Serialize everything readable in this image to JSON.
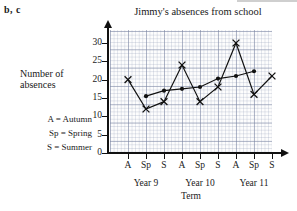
{
  "figure_tag": "b, c",
  "chart_data": {
    "type": "line",
    "title": "Jimmy's absences from school",
    "xlabel": "Term",
    "ylabel": "Number of absences",
    "ylim": [
      0,
      32
    ],
    "yticks": [
      0,
      5,
      10,
      15,
      20,
      25,
      30
    ],
    "grid": true,
    "legend_position": "none",
    "categories": [
      "A",
      "Sp",
      "S",
      "A",
      "Sp",
      "S",
      "A",
      "Sp",
      "S"
    ],
    "group_labels": [
      "Year 9",
      "Year 10",
      "Year 11"
    ],
    "series": [
      {
        "name": "Absences",
        "marker": "x",
        "x": [
          1,
          2,
          3,
          4,
          5,
          6,
          7,
          8,
          9
        ],
        "values": [
          20,
          12,
          14,
          24,
          14,
          18,
          30,
          16,
          21
        ]
      },
      {
        "name": "Moving average",
        "marker": "dot",
        "x": [
          2,
          3,
          4,
          5,
          6,
          7,
          8
        ],
        "values": [
          15.5,
          17,
          17.5,
          18,
          20.3,
          21,
          22.3
        ]
      }
    ],
    "annotations": [
      "A = Autumn",
      "Sp = Spring",
      "S = Summer"
    ]
  },
  "key": {
    "autumn": "A  =  Autumn",
    "spring": "Sp =  Spring",
    "summer": "S  =  Summer"
  },
  "ylabel_lines": {
    "line1": "Number of",
    "line2": "absences"
  }
}
